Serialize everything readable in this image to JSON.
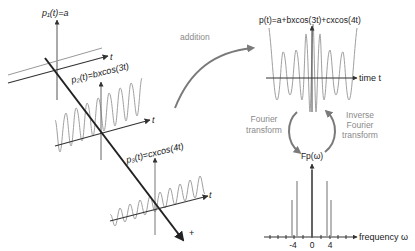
{
  "left": {
    "p1_label": "p₁(t)=a",
    "p2_label": "p₂(t)=bxcos(3t)",
    "p3_label": "p₃(t)=cxcos(4t)",
    "t_label": "t",
    "plus_label": "+"
  },
  "middle": {
    "addition_label": "addition"
  },
  "right_top": {
    "title": "p(t)=a+bxcos(3t)+cxcos(4t)",
    "x_axis_label": "time t"
  },
  "cycle": {
    "fourier_line1": "Fourier",
    "fourier_line2": "transform",
    "inverse_line1": "Inverse",
    "inverse_line2": "Fourier",
    "inverse_line3": "transform"
  },
  "right_bottom": {
    "y_label": "Fp(ω)",
    "x_axis_label": "frequency ω",
    "ticks": [
      "-4",
      "0",
      "4"
    ]
  },
  "colors": {
    "axis": "#3a3a3a",
    "wave": "#9a9a9a",
    "arrow": "#7a7a7a",
    "text_gray": "#8a8a8a",
    "text_dark": "#222222"
  }
}
